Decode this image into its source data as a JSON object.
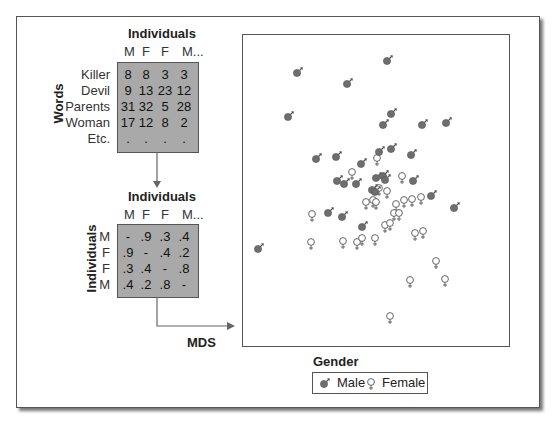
{
  "word_matrix": {
    "title": "Individuals",
    "col_headers": [
      "M",
      "F",
      "F",
      "M..."
    ],
    "row_axis_label": "Words",
    "rows": [
      {
        "label": "Killer",
        "values": [
          "8",
          "8",
          "3",
          "3"
        ]
      },
      {
        "label": "Devil",
        "values": [
          "9",
          "13",
          "23",
          "12"
        ]
      },
      {
        "label": "Parents",
        "values": [
          "31",
          "32",
          "5",
          "28"
        ]
      },
      {
        "label": "Woman",
        "values": [
          "17",
          "12",
          "8",
          "2"
        ]
      },
      {
        "label": "Etc.",
        "values": [
          ".",
          ".",
          ".",
          "."
        ]
      }
    ]
  },
  "distance_matrix": {
    "title": "Individuals",
    "col_headers": [
      "M",
      "F",
      "F",
      "M..."
    ],
    "row_axis_label": "Individuals",
    "rows": [
      {
        "label": "M",
        "values": [
          "-",
          ".9",
          ".3",
          ".4"
        ]
      },
      {
        "label": "F",
        "values": [
          ".9",
          "-",
          ".4",
          ".2"
        ]
      },
      {
        "label": "F",
        "values": [
          ".3",
          ".4",
          "-",
          ".8"
        ]
      },
      {
        "label": "M",
        "values": [
          ".4",
          ".2",
          ".8",
          "-"
        ]
      }
    ]
  },
  "arrow_label": "MDS",
  "legend": {
    "title": "Gender",
    "items": [
      {
        "symbol": "male-icon",
        "label": "Male",
        "color": "#6e6e6e"
      },
      {
        "symbol": "female-icon",
        "label": "Female",
        "color": "#ffffff"
      }
    ]
  },
  "chart_data": {
    "type": "scatter",
    "title": "",
    "xlabel": "",
    "ylabel": "",
    "grid": false,
    "legend_position": "bottom",
    "legend_title": "Gender",
    "note": "pixel coordinates within the figure (no axis ticks shown)",
    "series": [
      {
        "name": "Male",
        "points": [
          [
            297,
            73
          ],
          [
            387,
            61
          ],
          [
            347,
            84
          ],
          [
            288,
            117
          ],
          [
            391,
            114
          ],
          [
            383,
            125
          ],
          [
            422,
            125
          ],
          [
            446,
            123
          ],
          [
            316,
            159
          ],
          [
            336,
            157
          ],
          [
            379,
            152
          ],
          [
            391,
            149
          ],
          [
            411,
            155
          ],
          [
            361,
            164
          ],
          [
            337,
            181
          ],
          [
            344,
            184
          ],
          [
            356,
            184
          ],
          [
            376,
            178
          ],
          [
            383,
            176
          ],
          [
            385,
            180
          ],
          [
            413,
            181
          ],
          [
            372,
            190
          ],
          [
            375,
            192
          ],
          [
            431,
            196
          ],
          [
            454,
            208
          ],
          [
            328,
            213
          ],
          [
            342,
            217
          ],
          [
            362,
            227
          ],
          [
            258,
            249
          ]
        ]
      },
      {
        "name": "Female",
        "points": [
          [
            377,
            158
          ],
          [
            352,
            172
          ],
          [
            402,
            176
          ],
          [
            387,
            191
          ],
          [
            379,
            188
          ],
          [
            366,
            202
          ],
          [
            373,
            200
          ],
          [
            376,
            202
          ],
          [
            396,
            204
          ],
          [
            404,
            200
          ],
          [
            412,
            199
          ],
          [
            421,
            197
          ],
          [
            312,
            214
          ],
          [
            394,
            213
          ],
          [
            399,
            213
          ],
          [
            385,
            225
          ],
          [
            390,
            223
          ],
          [
            415,
            233
          ],
          [
            423,
            231
          ],
          [
            343,
            241
          ],
          [
            357,
            242
          ],
          [
            362,
            238
          ],
          [
            375,
            238
          ],
          [
            311,
            242
          ],
          [
            436,
            261
          ],
          [
            410,
            280
          ],
          [
            445,
            279
          ],
          [
            390,
            316
          ]
        ]
      }
    ]
  }
}
